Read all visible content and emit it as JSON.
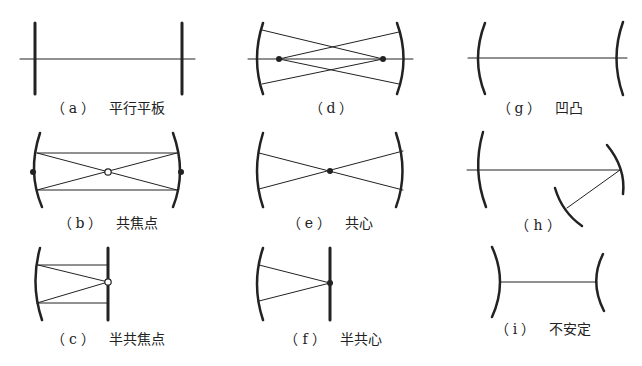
{
  "figure": {
    "colors": {
      "ink": "#222222",
      "background": "#ffffff"
    },
    "panels": [
      {
        "id": "a",
        "tag": "（a）",
        "name": "平行平板"
      },
      {
        "id": "b",
        "tag": "（b）",
        "name": "共焦点"
      },
      {
        "id": "c",
        "tag": "（c）",
        "name": "半共焦点"
      },
      {
        "id": "d",
        "tag": "（d）",
        "name": ""
      },
      {
        "id": "e",
        "tag": "（e）",
        "name": "共心"
      },
      {
        "id": "f",
        "tag": "（f）",
        "name": "半共心"
      },
      {
        "id": "g",
        "tag": "（g）",
        "name": "凹凸"
      },
      {
        "id": "h",
        "tag": "（h）",
        "name": ""
      },
      {
        "id": "i",
        "tag": "（i）",
        "name": "不安定"
      }
    ]
  }
}
